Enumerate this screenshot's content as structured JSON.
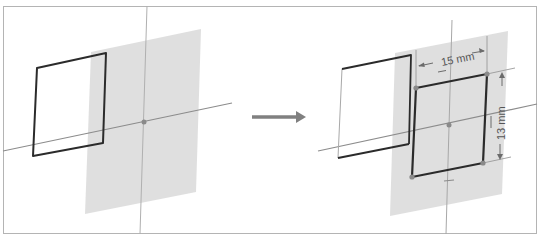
{
  "figure": {
    "frame": {
      "stroke": "#b4b4b4",
      "background": "#ffffff"
    },
    "colors": {
      "plane_fill": "#d9d9d9",
      "axis_line": "#8c8c8c",
      "construction_line": "#a8a8a8",
      "sketch_edge": "#2b2b2b",
      "point": "#8a8a8a",
      "arrow": "#808080",
      "dimension": "#6b6b6b"
    }
  },
  "panels": [
    {
      "id": "before",
      "label": "Unconstrained rectangle beside work plane",
      "plane": "91,52 201,29 196,192 85,214",
      "axes": {
        "horizontal": {
          "x1": 3,
          "y1": 151,
          "x2": 232,
          "y2": 103
        },
        "vertical": {
          "x1": 147,
          "y1": 6,
          "x2": 140,
          "y2": 234
        }
      },
      "origin": {
        "x": 144,
        "y": 122
      },
      "rectangle": "37,68 106,53 103,143 33,156"
    },
    {
      "id": "after",
      "label": "Rectangle projected onto plane and dimensioned",
      "plane": "395,53 508,31 502,194 390,216",
      "axes": {
        "horizontal": {
          "x1": 318,
          "y1": 151,
          "x2": 537,
          "y2": 104
        },
        "vertical": {
          "x1": 452,
          "y1": 20,
          "x2": 446,
          "y2": 234
        }
      },
      "origin": {
        "x": 449,
        "y": 125
      },
      "ghost_rectangle": "342,69 411,55 409,144 338,158",
      "rectangle": "416,88 487,74 483,163 412,177",
      "rectangle_points": [
        {
          "x": 416,
          "y": 88
        },
        {
          "x": 487,
          "y": 74
        },
        {
          "x": 483,
          "y": 163
        },
        {
          "x": 412,
          "y": 177
        }
      ],
      "dimensions": [
        {
          "id": "width",
          "text": "15 mm",
          "value": 15,
          "unit": "mm",
          "orientation": "horizontal"
        },
        {
          "id": "height",
          "text": "13 mm",
          "value": 13,
          "unit": "mm",
          "orientation": "vertical"
        }
      ]
    }
  ],
  "transition_arrow": {
    "x1": 252,
    "y1": 117,
    "x2": 305,
    "y2": 117,
    "meaning": "becomes"
  }
}
